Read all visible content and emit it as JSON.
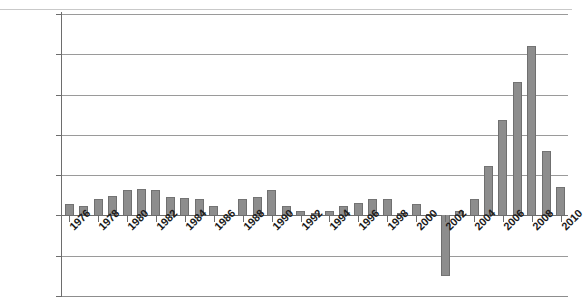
{
  "chart_data": {
    "type": "bar",
    "title": "",
    "xlabel": "",
    "ylabel": "",
    "ylim": [
      -100000,
      250000
    ],
    "ytick_values": [
      250000,
      200000,
      150000,
      100000,
      50000,
      0,
      -50000,
      -100000
    ],
    "ytick_labels": [
      "250,000",
      "200,000",
      "150,000",
      "100,000",
      "50,000",
      "0",
      "-50,000",
      "-100,000"
    ],
    "grid": true,
    "legend": "none",
    "xtick_labels": [
      "1976",
      "1978",
      "1980",
      "1982",
      "1984",
      "1986",
      "1988",
      "1990",
      "1992",
      "1994",
      "1996",
      "1998",
      "2000",
      "2002",
      "2004",
      "2006",
      "2008",
      "2010"
    ],
    "xtick_step_years": 2,
    "categories": [
      "1976",
      "1977",
      "1978",
      "1979",
      "1980",
      "1981",
      "1982",
      "1983",
      "1984",
      "1985",
      "1986",
      "1987",
      "1988",
      "1989",
      "1990",
      "1991",
      "1992",
      "1993",
      "1994",
      "1995",
      "1996",
      "1997",
      "1998",
      "1999",
      "2000",
      "2001",
      "2002",
      "2003",
      "2004",
      "2005",
      "2006",
      "2007",
      "2008",
      "2009",
      "2010"
    ],
    "values": [
      14000,
      12000,
      20000,
      24000,
      31000,
      33000,
      31000,
      23000,
      22000,
      20000,
      12000,
      0,
      21000,
      23000,
      32000,
      12000,
      5000,
      3000,
      5000,
      12000,
      16000,
      20000,
      21000,
      3000,
      14000,
      2000,
      -75000,
      5000,
      20000,
      61000,
      118000,
      166000,
      210000,
      80000,
      35000
    ],
    "bar_color": "#8d8d8d",
    "bar_edge_color": "#6f6f6f",
    "grid_color": "#9a9a9a",
    "axis_color": "#6d6d6d",
    "background": "#ffffff"
  }
}
